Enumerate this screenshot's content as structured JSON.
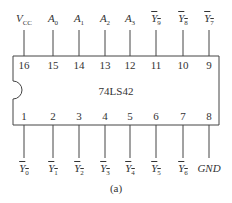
{
  "chip": {
    "name": "74LS42"
  },
  "caption": "(a)",
  "top_pins": [
    {
      "num": "16",
      "label": "V",
      "sub": "CC",
      "inverted": false
    },
    {
      "num": "15",
      "label": "A",
      "sub": "0",
      "inverted": false
    },
    {
      "num": "14",
      "label": "A",
      "sub": "1",
      "inverted": false
    },
    {
      "num": "13",
      "label": "A",
      "sub": "2",
      "inverted": false
    },
    {
      "num": "12",
      "label": "A",
      "sub": "3",
      "inverted": false
    },
    {
      "num": "11",
      "label": "Y",
      "sub": "9",
      "inverted": true
    },
    {
      "num": "10",
      "label": "Y",
      "sub": "8",
      "inverted": true
    },
    {
      "num": "9",
      "label": "Y",
      "sub": "7",
      "inverted": true
    }
  ],
  "bottom_pins": [
    {
      "num": "1",
      "label": "Y",
      "sub": "0",
      "inverted": true
    },
    {
      "num": "2",
      "label": "Y",
      "sub": "1",
      "inverted": true
    },
    {
      "num": "3",
      "label": "Y",
      "sub": "2",
      "inverted": true
    },
    {
      "num": "4",
      "label": "Y",
      "sub": "3",
      "inverted": true
    },
    {
      "num": "5",
      "label": "Y",
      "sub": "4",
      "inverted": true
    },
    {
      "num": "6",
      "label": "Y",
      "sub": "5",
      "inverted": true
    },
    {
      "num": "7",
      "label": "Y",
      "sub": "6",
      "inverted": true
    },
    {
      "num": "8",
      "label": "GND",
      "sub": "",
      "inverted": false
    }
  ]
}
